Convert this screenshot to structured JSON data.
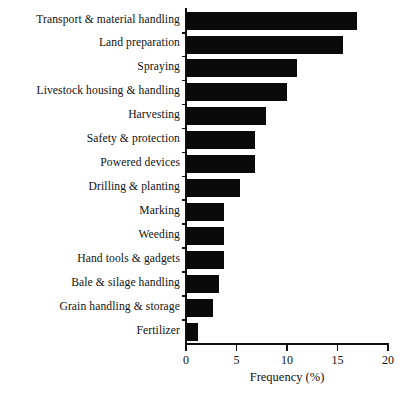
{
  "chart_data": {
    "type": "bar",
    "orientation": "horizontal",
    "title": "",
    "xlabel": "Frequency (%)",
    "ylabel": "",
    "xlim": [
      0,
      20
    ],
    "xticks": [
      0,
      5,
      10,
      15,
      20
    ],
    "xtick_labels": [
      "0",
      "5",
      "10",
      "15",
      "20"
    ],
    "grid": false,
    "legend": null,
    "bar_color": "#0a0a0a",
    "categories": [
      "Transport & material handling",
      "Land preparation",
      "Spraying",
      "Livestock housing & handling",
      "Harvesting",
      "Safety & protection",
      "Powered devices",
      "Drilling & planting",
      "Marking",
      "Weeding",
      "Hand tools & gadgets",
      "Bale & silage handling",
      "Grain handling & storage",
      "Fertilizer"
    ],
    "values": [
      16.9,
      15.5,
      11.0,
      10.0,
      7.9,
      6.8,
      6.8,
      5.3,
      3.8,
      3.8,
      3.8,
      3.3,
      2.7,
      1.2
    ]
  }
}
